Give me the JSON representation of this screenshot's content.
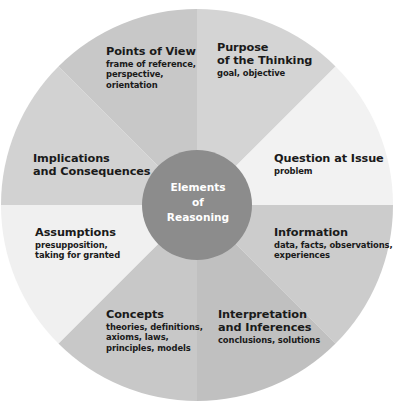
{
  "diagram": {
    "title": "Elements of Reasoning",
    "center": {
      "text": "Elements\nof\nReasoning",
      "fill": "#8c8c8c",
      "text_color": "#ffffff"
    },
    "colors": {
      "background": "#ffffff",
      "text": "#1a1a1a",
      "segment_light": "#f0f0f0",
      "segment_mid": "#d6d6d6",
      "segment_dark": "#c2c2c2",
      "segment_darker": "#b8b8b8"
    },
    "segments": [
      {
        "id": "points-of-view",
        "title": "Points of View",
        "subtitle": "frame of reference,\nperspective,\norientation",
        "fill": "#c8c8c8",
        "start_angle": -135,
        "end_angle": -90
      },
      {
        "id": "purpose-of-the-thinking",
        "title": "Purpose\nof the Thinking",
        "subtitle": "goal, objective",
        "fill": "#d4d4d4",
        "start_angle": -90,
        "end_angle": -45
      },
      {
        "id": "question-at-issue",
        "title": "Question at Issue",
        "subtitle": "problem",
        "fill": "#f2f2f2",
        "start_angle": -45,
        "end_angle": 0
      },
      {
        "id": "information",
        "title": "Information",
        "subtitle": "data, facts, observations,\nexperiences",
        "fill": "#cccccc",
        "start_angle": 0,
        "end_angle": 45
      },
      {
        "id": "interpretation-and-inferences",
        "title": "Interpretation\nand Inferences",
        "subtitle": "conclusions, solutions",
        "fill": "#c0c0c0",
        "start_angle": 45,
        "end_angle": 90
      },
      {
        "id": "concepts",
        "title": "Concepts",
        "subtitle": "theories, definitions,\naxioms, laws,\nprinciples, models",
        "fill": "#c8c8c8",
        "start_angle": 90,
        "end_angle": 135
      },
      {
        "id": "assumptions",
        "title": "Assumptions",
        "subtitle": "presupposition,\ntaking for granted",
        "fill": "#f0f0f0",
        "start_angle": 135,
        "end_angle": 180
      },
      {
        "id": "implications-and-consequences",
        "title": "Implications\nand Consequences",
        "subtitle": "",
        "fill": "#d2d2d2",
        "start_angle": 180,
        "end_angle": 225
      }
    ],
    "geometry": {
      "cx": 197,
      "cy": 205,
      "outer_radius": 196,
      "inner_radius": 55
    }
  }
}
